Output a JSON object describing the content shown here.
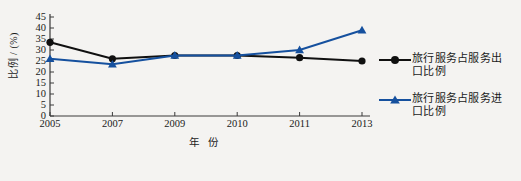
{
  "chart_data": {
    "type": "line",
    "title": "",
    "xlabel": "年 份",
    "ylabel": "比例 / (%)",
    "categories": [
      "2005",
      "2007",
      "2009",
      "2010",
      "2011",
      "2013"
    ],
    "ylim": [
      0,
      45
    ],
    "yticks": [
      0,
      5,
      10,
      15,
      20,
      25,
      30,
      35,
      40,
      45
    ],
    "grid": false,
    "legend_position": "right",
    "series": [
      {
        "name": "旅行服务占服务出口比例",
        "color": "#101010",
        "marker": "circle",
        "values": [
          33.5,
          26.0,
          27.5,
          27.5,
          26.5,
          25.0
        ]
      },
      {
        "name": "旅行服务占服务进口比例",
        "color": "#15509e",
        "marker": "triangle",
        "values": [
          26.0,
          23.5,
          27.5,
          27.5,
          30.0,
          39.0
        ]
      }
    ]
  },
  "axis": {
    "y_title": "比例 / (%)",
    "x_title": "年 份",
    "y_tick_labels": [
      "45",
      "40",
      "35",
      "30",
      "25",
      "20",
      "15",
      "10",
      "5",
      "0"
    ],
    "x_tick_labels": [
      "2005",
      "2007",
      "2009",
      "2010",
      "2011",
      "2013"
    ]
  },
  "legend": {
    "entries": [
      {
        "label": "旅行服务占服务出口比例",
        "color": "#101010",
        "marker": "circle"
      },
      {
        "label": "旅行服务占服务进口比例",
        "color": "#15509e",
        "marker": "triangle"
      }
    ]
  },
  "colors": {
    "background": "#f4f3f1",
    "axis": "#3a3a3a",
    "series_export": "#101010",
    "series_import": "#15509e"
  }
}
